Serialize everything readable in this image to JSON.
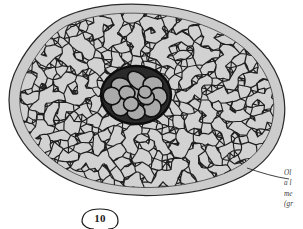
{
  "figure": {
    "kind": "histological-cross-section",
    "number_label": "10",
    "colors": {
      "background": "#ffffff",
      "outer_rim": "#c9c9c9",
      "ground_tissue": "#d2d2d2",
      "cell_fill": "#c4c4c4",
      "cell_wall": "#1a1a1a",
      "outline": "#2b2b2b",
      "central_cell_fill": "#a9a9a9",
      "central_wall": "#111111",
      "caption_text": "#3a3a3a"
    }
  },
  "caption": {
    "lines": [
      "Ol",
      "a l",
      "me",
      "(gr"
    ],
    "note": "clipped-at-right-edge"
  },
  "leader": {
    "name": "outer-rim-leader-line"
  },
  "chart_data": {
    "type": "scatter",
    "xlabel": "",
    "ylabel": "",
    "regions": [
      {
        "name": "outer-rim-band",
        "fill": "#c9c9c9",
        "description": "smooth light grey epidermis-cortex band surrounding tissue"
      },
      {
        "name": "cortex-cell-network",
        "fill": "#c4c4c4",
        "description": "dense polygonal parenchyma cell network"
      },
      {
        "name": "central-bundle",
        "fill": "#a9a9a9",
        "description": "central cluster of large rounded cells with thick dark walls",
        "cell_count": 13
      }
    ],
    "annotations": [
      {
        "text": "10",
        "role": "figure-number",
        "x": 100,
        "y": 219
      },
      {
        "text": "Ol",
        "role": "caption-line",
        "x": 295,
        "y": 178
      },
      {
        "text": "a l",
        "role": "caption-line",
        "x": 295,
        "y": 188
      },
      {
        "text": "me",
        "role": "caption-line",
        "x": 295,
        "y": 199
      },
      {
        "text": "(gr",
        "role": "caption-line",
        "x": 295,
        "y": 209
      }
    ]
  }
}
